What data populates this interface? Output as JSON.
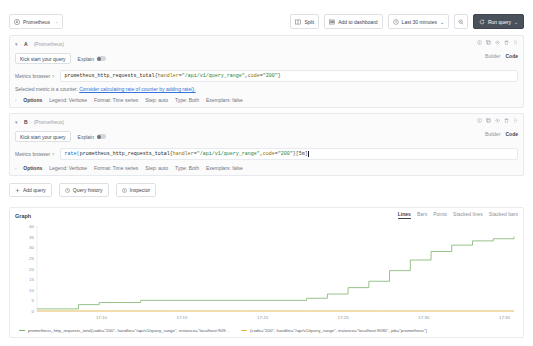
{
  "toolbar": {
    "datasource": {
      "label": "Prometheus",
      "icon": "prometheus-icon",
      "chevron": "⌄"
    },
    "split_label": "Split",
    "add_to_dashboard_label": "Add to dashboard",
    "time_range_label": "Last 30 minutes",
    "time_range_chevron": "⌄",
    "zoom_out_icon": "magnifier-minus-icon",
    "refresh_icon": "refresh-icon",
    "run_query_label": "Run query",
    "run_query_chevron": "⌄"
  },
  "queries": [
    {
      "ref": "A",
      "datasource": "(Prometheus)",
      "collapse_icon": "▾",
      "kick_start_label": "Kick start your query",
      "explain_label": "Explain",
      "explain_on": false,
      "mode_builder": "Builder",
      "mode_code": "Code",
      "metric_browser_label": "Metrics browser",
      "metric_browser_arrow": ">",
      "expression": {
        "fn": "",
        "metric": "prometheus_http_requests_total",
        "brace_open": "{",
        "label1": "handler",
        "eq1": "=",
        "value1": "\"/api/v1/query_range\"",
        "comma": ", ",
        "label2": "code",
        "eq2": "=",
        "value2": "\"200\"",
        "brace_close": "}",
        "suffix": ""
      },
      "hint_text": "Selected metric is a counter.",
      "hint_link": "Consider calculating rate of counter by adding rate().",
      "options": {
        "title": "Options",
        "caret": "›",
        "items": [
          "Legend: Verbose",
          "Format: Time series",
          "Step: auto",
          "Type: Both",
          "Exemplars: false"
        ]
      }
    },
    {
      "ref": "B",
      "datasource": "(Prometheus)",
      "collapse_icon": "▾",
      "kick_start_label": "Kick start your query",
      "explain_label": "Explain",
      "explain_on": false,
      "mode_builder": "Builder",
      "mode_code": "Code",
      "metric_browser_label": "Metrics browser",
      "metric_browser_arrow": ">",
      "expression": {
        "fn": "rate(",
        "metric": "prometheus_http_requests_total",
        "brace_open": "{",
        "label1": "handler",
        "eq1": "=",
        "value1": "\"/api/v1/query_range\"",
        "comma": ", ",
        "label2": "code",
        "eq2": "=",
        "value2": "\"200\"",
        "brace_close": "}",
        "suffix": "[5m]"
      },
      "hint_text": "",
      "hint_link": "",
      "options": {
        "title": "Options",
        "caret": "›",
        "items": [
          "Legend: Verbose",
          "Format: Time series",
          "Step: auto",
          "Type: Both",
          "Exemplars: false"
        ]
      }
    }
  ],
  "actions": {
    "add_query_label": "Add query",
    "add_query_icon": "plus-icon",
    "query_history_label": "Query history",
    "query_history_icon": "history-icon",
    "inspector_label": "Inspector",
    "inspector_icon": "info-icon"
  },
  "graph_panel": {
    "title": "Graph",
    "viz_options": [
      "Lines",
      "Bars",
      "Points",
      "Stacked lines",
      "Stacked bars"
    ],
    "viz_selected": "Lines",
    "legend": [
      {
        "color": "#7eb26d",
        "label": "prometheus_http_requests_total{code=\"200\", handler=\"/api/v1/query_range\", instance=\"localhost:909..."
      },
      {
        "color": "#eab839",
        "label": "{code=\"200\", handler=\"/api/v1/query_range\", instance=\"localhost:9090\", job=\"prometheus\"}"
      }
    ]
  },
  "chart_data": {
    "type": "line",
    "title": "Graph",
    "xlabel": "",
    "ylabel": "",
    "ylim": [
      0,
      40
    ],
    "yticks": [
      0,
      5,
      10,
      15,
      20,
      25,
      30,
      35,
      40
    ],
    "xticks": [
      "17:10",
      "17:15",
      "17:20",
      "17:25",
      "17:30",
      "17:35"
    ],
    "grid": false,
    "legend_position": "bottom",
    "series": [
      {
        "name": "prometheus_http_requests_total{code=\"200\", handler=\"/api/v1/query_range\", instance=\"localhost:909...",
        "color": "#7eb26d",
        "x": [
          "17:06",
          "17:08",
          "17:10",
          "17:11",
          "17:12",
          "17:13",
          "17:14",
          "17:16",
          "17:18",
          "17:20",
          "17:22",
          "17:24",
          "17:25",
          "17:26",
          "17:27",
          "17:28",
          "17:29",
          "17:30",
          "17:31",
          "17:32",
          "17:33",
          "17:34",
          "17:35",
          "17:36"
        ],
        "values": [
          1,
          1,
          3,
          4,
          4,
          5,
          5,
          5,
          5,
          5,
          5,
          5,
          5,
          6,
          8,
          11,
          14,
          19,
          24,
          28,
          31,
          33,
          34,
          35
        ]
      },
      {
        "name": "{code=\"200\", handler=\"/api/v1/query_range\", instance=\"localhost:9090\", job=\"prometheus\"}",
        "color": "#eab839",
        "x": [
          "17:06",
          "17:10",
          "17:15",
          "17:20",
          "17:25",
          "17:30",
          "17:35",
          "17:36"
        ],
        "values": [
          0,
          0,
          0,
          0,
          0,
          0,
          0,
          0
        ]
      }
    ]
  }
}
